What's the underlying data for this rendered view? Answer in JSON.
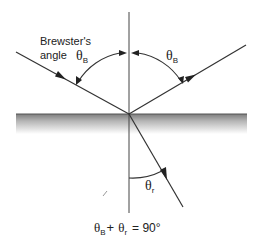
{
  "diagram": {
    "labels": {
      "brewster_line1": "Brewster's",
      "brewster_line2": "angle",
      "theta": "θ",
      "sub_B": "B",
      "sub_r": "r"
    },
    "equation": {
      "theta1": "θ",
      "sub1": "B",
      "plus": "+",
      "theta2": "θ",
      "sub2": "r",
      "rhs": "= 90°"
    },
    "rays": [
      "incident",
      "reflected",
      "refracted"
    ],
    "angles": [
      "theta_B incident",
      "theta_B reflected",
      "theta_r refracted"
    ],
    "colors": {
      "line": "#333333",
      "interface_top": "#8a8a8a",
      "interface_bottom": "#ffffff"
    }
  }
}
